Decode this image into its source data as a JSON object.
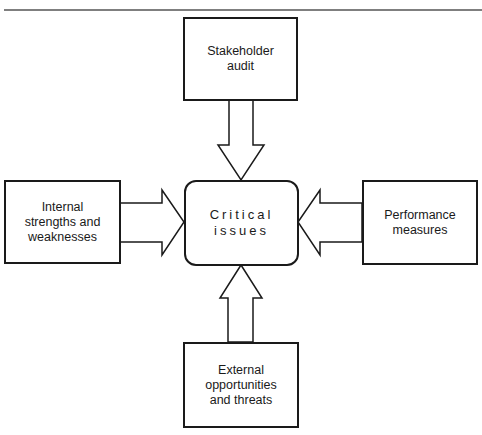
{
  "diagram": {
    "center": {
      "label": "Critical\nissues"
    },
    "top": {
      "label": "Stakeholder\naudit"
    },
    "left": {
      "label": "Internal\nstrengths and\nweaknesses"
    },
    "right": {
      "label": "Performance\nmeasures"
    },
    "bottom": {
      "label": "External\nopportunities\nand threats"
    },
    "arrows": [
      {
        "from": "top",
        "to": "center"
      },
      {
        "from": "left",
        "to": "center"
      },
      {
        "from": "right",
        "to": "center"
      },
      {
        "from": "bottom",
        "to": "center"
      }
    ],
    "line_color": "#1a1a1a"
  }
}
